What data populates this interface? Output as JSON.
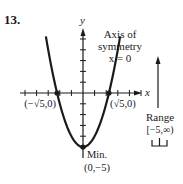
{
  "problem_number": "13.",
  "axes": {
    "x_label": "x",
    "y_label": "y",
    "x_ticks_each_side": 5,
    "y_ticks_above": 5,
    "y_ticks_below": 5
  },
  "function": {
    "description": "parabola y = x^2 - 5",
    "a": 1,
    "c": -5,
    "x_domain": [
      -3.2,
      3.2
    ]
  },
  "points": [
    {
      "name": "left-intercept",
      "x": -2.236,
      "y": 0,
      "label": "(−√5,0)"
    },
    {
      "name": "right-intercept",
      "x": 2.236,
      "y": 0,
      "label": "(√5,0)"
    },
    {
      "name": "vertex",
      "x": 0,
      "y": -5,
      "label_line1": "Min.",
      "label_line2": "(0,−5)"
    }
  ],
  "annotations": {
    "axis_symmetry_line1": "Axis of",
    "axis_symmetry_line2": "symmetry",
    "axis_symmetry_line3": "x = 0",
    "range_label": "Range",
    "range_value": "[−5,∞)"
  },
  "colors": {
    "ink": "#1a1a1a",
    "background": "#ffffff"
  }
}
